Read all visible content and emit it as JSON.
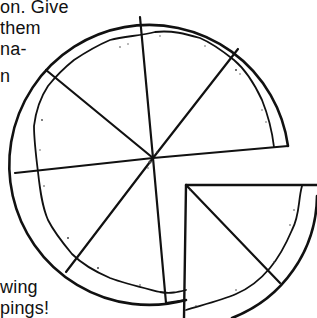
{
  "text_fragments": {
    "line1": "on.  Give",
    "line2": " them",
    "line3": "na-",
    "line4": "n",
    "bottom1": "wing",
    "bottom2": "pings!"
  },
  "diagram": {
    "slices_total": 8,
    "slices_removed": 1,
    "colors": {
      "stroke": "#111111",
      "background": "#ffffff",
      "sauce_speckle": "#555555"
    }
  }
}
